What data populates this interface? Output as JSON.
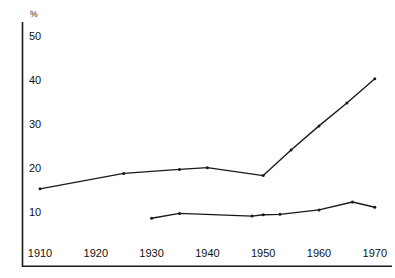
{
  "chart_data": {
    "type": "line",
    "title": "",
    "subtitle": "",
    "xlabel": "",
    "ylabel": "%",
    "unit_label": "%",
    "x": [
      1910,
      1915,
      1920,
      1925,
      1930,
      1935,
      1940,
      1945,
      1950,
      1955,
      1960,
      1965,
      1970
    ],
    "xlim": [
      1907,
      1973
    ],
    "ylim": [
      0,
      52
    ],
    "xticks": [
      1910,
      1920,
      1930,
      1940,
      1950,
      1960,
      1970
    ],
    "xtick_labels": [
      "1910",
      "1920",
      "1930",
      "1940",
      "1950",
      "1960",
      "1970"
    ],
    "yticks": [
      10,
      20,
      30,
      40,
      50
    ],
    "ytick_labels": [
      "10",
      "20",
      "30",
      "40",
      "50"
    ],
    "grid": false,
    "legend": "none",
    "line_color": "#1a1a1a",
    "marker": "dot",
    "series": [
      {
        "name": "upper-series",
        "points": [
          {
            "x": 1910,
            "y": 15.5
          },
          {
            "x": 1925,
            "y": 19.0
          },
          {
            "x": 1935,
            "y": 19.9
          },
          {
            "x": 1940,
            "y": 20.3
          },
          {
            "x": 1950,
            "y": 18.5
          },
          {
            "x": 1955,
            "y": 24.3
          },
          {
            "x": 1960,
            "y": 29.8
          },
          {
            "x": 1965,
            "y": 35.0
          },
          {
            "x": 1970,
            "y": 40.5
          }
        ]
      },
      {
        "name": "lower-series",
        "points": [
          {
            "x": 1930,
            "y": 8.8
          },
          {
            "x": 1935,
            "y": 9.9
          },
          {
            "x": 1948,
            "y": 9.3
          },
          {
            "x": 1950,
            "y": 9.6
          },
          {
            "x": 1953,
            "y": 9.7
          },
          {
            "x": 1960,
            "y": 10.7
          },
          {
            "x": 1966,
            "y": 12.5
          },
          {
            "x": 1970,
            "y": 11.3
          }
        ]
      }
    ]
  }
}
